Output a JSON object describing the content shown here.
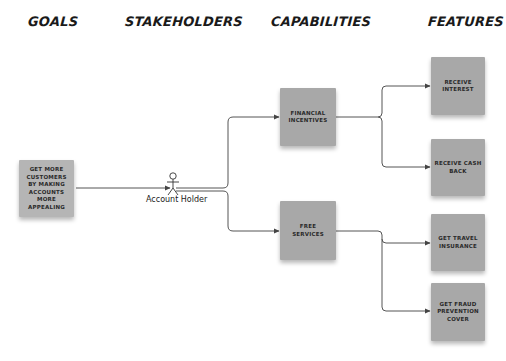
{
  "columns": {
    "goals": "GOALS",
    "stakeholders": "STAKEHOLDERS",
    "capabilities": "CAPABILITIES",
    "features": "FEATURES"
  },
  "goal": {
    "label": "GET MORE CUSTOMERS BY MAKING ACCOUNTS MORE APPEALING"
  },
  "stakeholder": {
    "label": "Account Holder",
    "icon": "stick-figure-actor-icon"
  },
  "capabilities": [
    {
      "label": "FINANCIAL INCENTIVES"
    },
    {
      "label": "FREE SERVICES"
    }
  ],
  "features": [
    {
      "label": "RECEIVE INTEREST",
      "capability": "FINANCIAL INCENTIVES"
    },
    {
      "label": "RECEIVE CASH BACK",
      "capability": "FINANCIAL INCENTIVES"
    },
    {
      "label": "GET TRAVEL INSURANCE",
      "capability": "FREE SERVICES"
    },
    {
      "label": "GET FRAUD PREVENTION COVER",
      "capability": "FREE SERVICES"
    }
  ],
  "colors": {
    "box_fill": "#a8a8a8",
    "connector": "#555555",
    "text": "#2a2a2a"
  }
}
